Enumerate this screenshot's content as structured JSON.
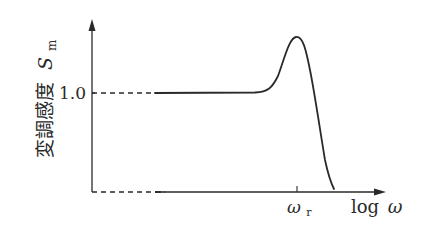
{
  "diagram": {
    "type": "frequency-response-sketch",
    "y_axis": {
      "label_main": "変調感度",
      "label_symbol": "S",
      "label_subscript": "m",
      "tick_label": "1.0"
    },
    "x_axis": {
      "label_prefix": "log",
      "label_symbol": "ω",
      "tick_symbol": "ω",
      "tick_subscript": "r"
    },
    "curve": {
      "description": "flat at 1.0, resonant peak at ω_r, then steep roll-off",
      "baseline_level": 1.0
    },
    "colors": {
      "line": "#2a2a2a",
      "background": "#ffffff"
    }
  }
}
